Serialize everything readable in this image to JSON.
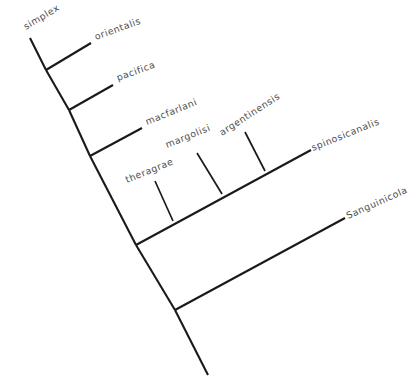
{
  "figure": {
    "kind": "phylogenetic-cladogram",
    "width": 419,
    "height": 390,
    "background_color": "#ffffff",
    "line_color": "#1a1a1a",
    "label_color": "#4d4d4d",
    "rotation_note": "tree drawn rotated, root at bottom center, tips fanning to upper right"
  },
  "taxa": [
    {
      "id": "simplex",
      "label": "simplex",
      "x": 26,
      "y": 30,
      "rotation": -31
    },
    {
      "id": "orientalis",
      "label": "orientalis",
      "x": 96,
      "y": 40,
      "rotation": -20
    },
    {
      "id": "pacifica",
      "label": "pacifica",
      "x": 118,
      "y": 81,
      "rotation": -20
    },
    {
      "id": "macfarlani",
      "label": "macfarlani",
      "x": 147,
      "y": 125,
      "rotation": -22
    },
    {
      "id": "margolisi",
      "label": "margolisi",
      "x": 167,
      "y": 148,
      "rotation": -22
    },
    {
      "id": "argentinensis",
      "label": "argentinensis",
      "x": 222,
      "y": 136,
      "rotation": -33
    },
    {
      "id": "theragrae",
      "label": "theragrae",
      "x": 127,
      "y": 183,
      "rotation": -22
    },
    {
      "id": "spinosicanalis",
      "label": "spinosicanalis",
      "x": 313,
      "y": 151,
      "rotation": -22
    },
    {
      "id": "Sanguinicola",
      "label": "Sanguinicola",
      "x": 348,
      "y": 219,
      "rotation": -24
    }
  ],
  "nodes": [
    {
      "id": "root",
      "x": 208,
      "y": 375
    },
    {
      "id": "node-1",
      "x": 175,
      "y": 310,
      "splits": [
        "Sanguinicola",
        "node-2"
      ]
    },
    {
      "id": "node-2",
      "x": 136,
      "y": 245,
      "splits": [
        "ingroup-clade",
        "node-3"
      ]
    },
    {
      "id": "node-3",
      "x": 90,
      "y": 156,
      "splits": [
        "macfarlani",
        "node-4"
      ]
    },
    {
      "id": "node-4",
      "x": 69,
      "y": 110,
      "splits": [
        "pacifica",
        "node-5"
      ]
    },
    {
      "id": "node-5",
      "x": 46,
      "y": 70,
      "splits": [
        "orientalis",
        "simplex"
      ]
    },
    {
      "id": "polytomy-base",
      "x": 175,
      "y": 220,
      "splits": [
        "theragrae",
        "margolisi",
        "argentinensis",
        "spinosicanalis"
      ]
    }
  ],
  "branches": [
    {
      "from": "root",
      "to": "node-1",
      "type": "backbone"
    },
    {
      "from": "node-1",
      "to": "node-2",
      "type": "backbone"
    },
    {
      "from": "node-2",
      "to": "node-3",
      "type": "backbone"
    },
    {
      "from": "node-3",
      "to": "node-4",
      "type": "backbone"
    },
    {
      "from": "node-4",
      "to": "node-5",
      "type": "backbone"
    },
    {
      "from": "node-5",
      "to": "simplex",
      "type": "terminal"
    },
    {
      "from": "node-5",
      "to": "orientalis",
      "type": "terminal"
    },
    {
      "from": "node-4",
      "to": "pacifica",
      "type": "terminal"
    },
    {
      "from": "node-3",
      "to": "macfarlani",
      "type": "terminal"
    },
    {
      "from": "node-2",
      "to": "spinosicanalis",
      "type": "terminal-long"
    },
    {
      "from": "node-1",
      "to": "Sanguinicola",
      "type": "terminal-long"
    },
    {
      "from": "polytomy-base",
      "to": "theragrae",
      "type": "perpendicular"
    },
    {
      "from": "polytomy-base",
      "to": "margolisi",
      "type": "perpendicular"
    },
    {
      "from": "polytomy-base",
      "to": "argentinensis",
      "type": "perpendicular"
    }
  ],
  "counts": {
    "tip_count": 9,
    "internal_node_count": 6
  }
}
